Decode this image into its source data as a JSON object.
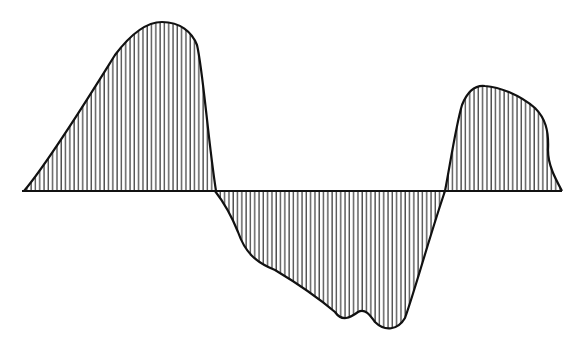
{
  "figure": {
    "stroke_color": "#111111",
    "hatch_color": "#222222",
    "background": "#ffffff",
    "baseline": {
      "y": 191,
      "x_start": 22,
      "x_end": 562
    },
    "lobes": [
      {
        "name": "positive-lobe-1",
        "sign": "positive",
        "x_start": 24,
        "x_end": 215,
        "peak": [
          160,
          22
        ]
      },
      {
        "name": "negative-lobe",
        "sign": "negative",
        "x_start": 215,
        "x_end": 445,
        "trough": [
          390,
          328
        ]
      },
      {
        "name": "positive-lobe-2",
        "sign": "positive",
        "x_start": 445,
        "x_end": 562,
        "peak": [
          482,
          87
        ]
      }
    ],
    "hatch_spacing_px": 4.3
  }
}
